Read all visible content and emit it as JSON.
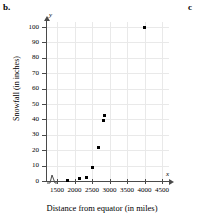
{
  "panels": {
    "current_label": "b.",
    "next_label": "c"
  },
  "chart_data": {
    "type": "scatter",
    "title": "",
    "xlabel": "Distance from equator (in miles)",
    "ylabel": "Snowfall (in inches)",
    "x_axis_letter": "x",
    "y_axis_letter": "y",
    "xlim": [
      1300,
      4700
    ],
    "ylim": [
      0,
      105
    ],
    "xticks": [
      1500,
      2000,
      2500,
      3000,
      3500,
      4000,
      4500
    ],
    "yticks": [
      0,
      10,
      20,
      30,
      40,
      50,
      60,
      70,
      80,
      90,
      100
    ],
    "xtick_labels": [
      "1500",
      "2000",
      "2500",
      "3000",
      "3500",
      "4000",
      "4500"
    ],
    "ytick_labels": [
      "0",
      "10",
      "20",
      "30",
      "40",
      "50",
      "60",
      "70",
      "80",
      "90",
      "100"
    ],
    "grid": true,
    "axis_break_x": true,
    "legend": "none",
    "marker": "filled-square",
    "marker_color": "#000000",
    "points": [
      {
        "x": 1800,
        "y": 0.5
      },
      {
        "x": 2150,
        "y": 1.5
      },
      {
        "x": 2350,
        "y": 2.5
      },
      {
        "x": 2500,
        "y": 9
      },
      {
        "x": 2680,
        "y": 21.5
      },
      {
        "x": 2820,
        "y": 39
      },
      {
        "x": 2850,
        "y": 42.5
      },
      {
        "x": 4000,
        "y": 100
      }
    ]
  },
  "colors": {
    "grid": "#e9e9e9",
    "axis": "#4a4a4a",
    "marker": "#000000",
    "background": "#ffffff"
  }
}
